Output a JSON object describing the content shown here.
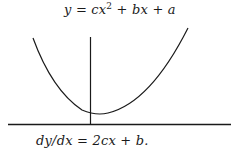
{
  "diagram": {
    "title_equation": {
      "lhs": "y",
      "op": " = ",
      "term1": "cx",
      "exp": "2",
      "rest": " + bx + a"
    },
    "derivative_equation": "dy/dx = 2cx + b.",
    "elements": {
      "curve": "upward-opening parabola",
      "vertical_axis": "y-axis",
      "horizontal_axis": "x-axis"
    },
    "colors": {
      "stroke": "#1a1a1a",
      "background": "#ffffff"
    }
  }
}
